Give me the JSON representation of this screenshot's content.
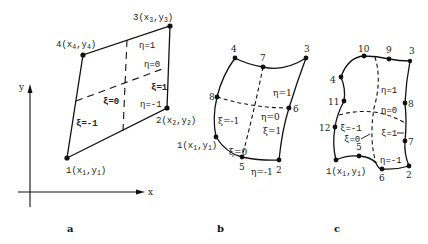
{
  "figure": {
    "panels": [
      {
        "id": "a",
        "caption": "a",
        "element_type": "4-node linear quadrilateral",
        "axes": {
          "x_label": "x",
          "y_label": "y"
        },
        "nodes": [
          {
            "id": "1",
            "label_num": "1",
            "label": "1(x1,y1)",
            "coord_x": "x",
            "coord_xsub": "1",
            "coord_y": "y",
            "coord_ysub": "1"
          },
          {
            "id": "2",
            "label_num": "2",
            "label": "2(x2,y2)",
            "coord_x": "x",
            "coord_xsub": "2",
            "coord_y": "y",
            "coord_ysub": "2"
          },
          {
            "id": "3",
            "label_num": "3",
            "label": "3(x3,y3)",
            "coord_x": "x",
            "coord_xsub": "3",
            "coord_y": "y",
            "coord_ysub": "3"
          },
          {
            "id": "4",
            "label_num": "4",
            "label": "4(x4,y4)",
            "coord_x": "x",
            "coord_xsub": "4",
            "coord_y": "y",
            "coord_ysub": "4"
          }
        ],
        "iso_labels": {
          "eta_pos1": "η=1",
          "eta_0": "η=0",
          "eta_neg1": "η=-1",
          "xi_pos1": "ξ=1",
          "xi_0": "ξ=0",
          "xi_neg1": "ξ=-1"
        }
      },
      {
        "id": "b",
        "caption": "b",
        "element_type": "8-node quadratic quadrilateral",
        "nodes": [
          "1",
          "2",
          "3",
          "4",
          "5",
          "6",
          "7",
          "8"
        ],
        "node1_label": {
          "num": "1",
          "x": "x",
          "xsub": "1",
          "y": "y",
          "ysub": "1"
        },
        "iso_labels": {
          "eta_pos1": "η=1",
          "eta_0": "η=0",
          "eta_neg1": "η=-1",
          "xi_pos1": "ξ=1",
          "xi_0": "ξ=0",
          "xi_neg1": "ξ=-1"
        }
      },
      {
        "id": "c",
        "caption": "c",
        "element_type": "12-node cubic quadrilateral",
        "nodes": [
          "1",
          "2",
          "3",
          "4",
          "5",
          "6",
          "7",
          "8",
          "9",
          "10",
          "11",
          "12"
        ],
        "node1_label": {
          "num": "1",
          "x": "x",
          "xsub": "1",
          "y": "y",
          "ysub": "1"
        },
        "iso_labels": {
          "eta_pos1": "η=1",
          "eta_0": "η=0",
          "eta_neg1": "η=-1",
          "xi_pos1": "ξ=1",
          "xi_0": "ξ=0",
          "xi_neg1": "ξ=-1"
        }
      }
    ]
  }
}
